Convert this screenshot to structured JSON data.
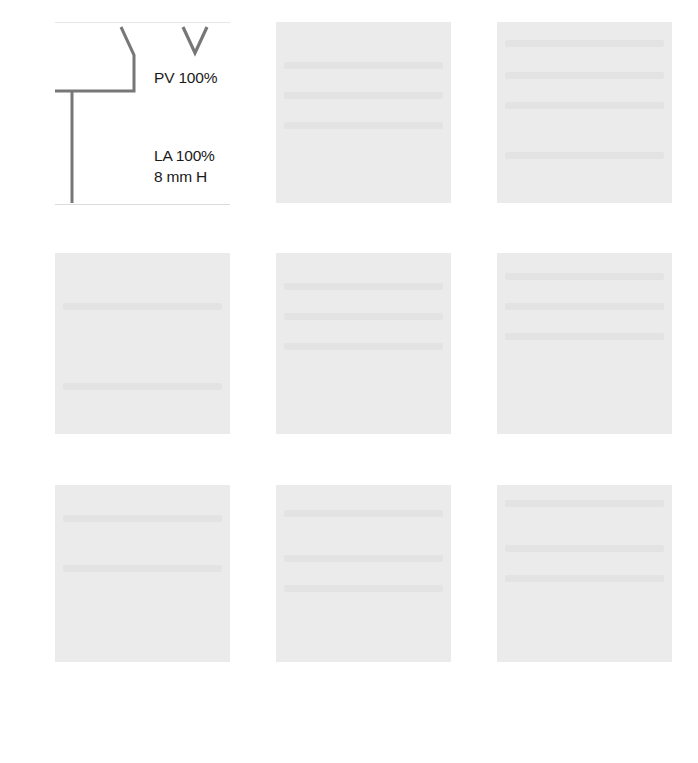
{
  "grid": {
    "rows": 3,
    "cols": 3,
    "tiles": [
      {
        "id": "tile-1-1",
        "type": "diagram",
        "labels": {
          "pv": "PV 100%",
          "la": "LA 100%",
          "mmh": "8 mm H"
        },
        "line_color": "#777777"
      },
      {
        "id": "tile-1-2",
        "type": "faded"
      },
      {
        "id": "tile-1-3",
        "type": "faded"
      },
      {
        "id": "tile-2-1",
        "type": "faded"
      },
      {
        "id": "tile-2-2",
        "type": "faded"
      },
      {
        "id": "tile-2-3",
        "type": "faded"
      },
      {
        "id": "tile-3-1",
        "type": "faded"
      },
      {
        "id": "tile-3-2",
        "type": "faded"
      },
      {
        "id": "tile-3-3",
        "type": "faded"
      }
    ]
  }
}
